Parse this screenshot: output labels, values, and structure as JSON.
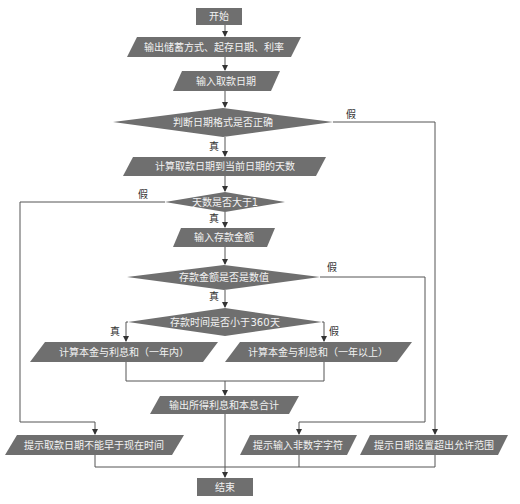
{
  "diagram": {
    "type": "flowchart",
    "colors": {
      "shape_fill": "#6f6f6f",
      "shape_text": "#f2f2f2",
      "line": "#555555",
      "edge_label": "#333333"
    },
    "nodes": {
      "start": {
        "label": "开始",
        "shape": "rect"
      },
      "output_info": {
        "label": "输出储蓄方式、起存日期、利率",
        "shape": "parallelogram"
      },
      "input_withdraw_date": {
        "label": "输入取款日期",
        "shape": "parallelogram"
      },
      "check_date_format": {
        "label": "判断日期格式是否正确",
        "shape": "diamond"
      },
      "calc_days": {
        "label": "计算取款日期到当前日期的天数",
        "shape": "parallelogram"
      },
      "check_days": {
        "label": "天数是否大于1",
        "shape": "diamond"
      },
      "input_amount": {
        "label": "输入存款金额",
        "shape": "parallelogram"
      },
      "check_amount_numeric": {
        "label": "存款金额是否是数值",
        "shape": "diamond"
      },
      "check_under_360": {
        "label": "存款时间是否小于360天",
        "shape": "diamond"
      },
      "calc_within_year": {
        "label": "计算本金与利息和（一年内）",
        "shape": "parallelogram"
      },
      "calc_over_year": {
        "label": "计算本金与利息和（一年以上）",
        "shape": "parallelogram"
      },
      "output_total": {
        "label": "输出所得利息和本息合计",
        "shape": "parallelogram"
      },
      "warn_date_early": {
        "label": "提示取款日期不能早于现在时间",
        "shape": "parallelogram"
      },
      "warn_non_numeric": {
        "label": "提示输入非数字字符",
        "shape": "parallelogram"
      },
      "warn_date_range": {
        "label": "提示日期设置超出允许范围",
        "shape": "parallelogram"
      },
      "end": {
        "label": "结束",
        "shape": "rect"
      }
    },
    "edge_labels": {
      "format_false": "假",
      "format_true": "真",
      "days_false": "假",
      "days_true": "真",
      "amount_false": "假",
      "amount_true": "真",
      "under360_true": "真",
      "under360_false": "假"
    },
    "edges": [
      [
        "start",
        "output_info"
      ],
      [
        "output_info",
        "input_withdraw_date"
      ],
      [
        "input_withdraw_date",
        "check_date_format"
      ],
      [
        "check_date_format",
        "calc_days",
        "真"
      ],
      [
        "check_date_format",
        "warn_date_range",
        "假"
      ],
      [
        "calc_days",
        "check_days"
      ],
      [
        "check_days",
        "input_amount",
        "真"
      ],
      [
        "check_days",
        "warn_date_early",
        "假"
      ],
      [
        "input_amount",
        "check_amount_numeric"
      ],
      [
        "check_amount_numeric",
        "check_under_360",
        "真"
      ],
      [
        "check_amount_numeric",
        "warn_non_numeric",
        "假"
      ],
      [
        "check_under_360",
        "calc_within_year",
        "真"
      ],
      [
        "check_under_360",
        "calc_over_year",
        "假"
      ],
      [
        "calc_within_year",
        "output_total"
      ],
      [
        "calc_over_year",
        "output_total"
      ],
      [
        "output_total",
        "end"
      ],
      [
        "warn_date_early",
        "end"
      ],
      [
        "warn_non_numeric",
        "end"
      ],
      [
        "warn_date_range",
        "end"
      ]
    ]
  }
}
